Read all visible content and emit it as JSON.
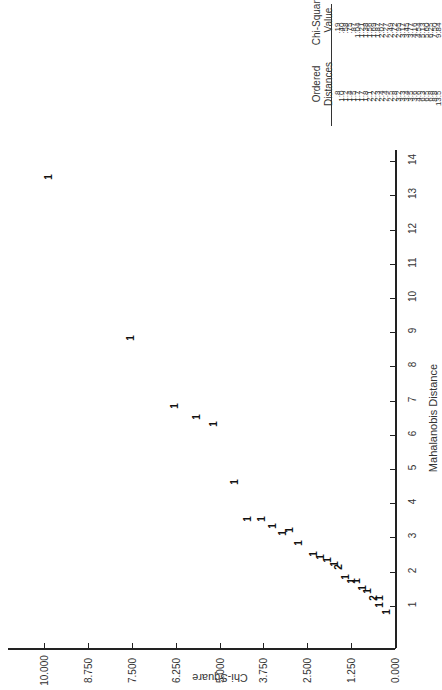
{
  "chart_data": {
    "type": "scatter",
    "title": "",
    "orientation_note_visible": "page rotated 90 degrees",
    "xlabel": "Mahalanobis Distance",
    "ylabel": "Chi-Square",
    "x_ticks": [
      "1",
      "2",
      "3",
      "4",
      "5",
      "6",
      "7",
      "8",
      "9",
      "10",
      "11",
      "12",
      "13",
      "14"
    ],
    "y_ticks": [
      "0.000",
      "1.250",
      "2.500",
      "3.750",
      "5.000",
      "6.250",
      "7.500",
      "8.750",
      "10.000"
    ],
    "xlim": [
      0,
      14.5
    ],
    "ylim": [
      0,
      10.5
    ],
    "grid": false,
    "marker_glyph": "1",
    "points": [
      {
        "x": 0.8,
        "y": 0.19,
        "label": "1"
      },
      {
        "x": 1.0,
        "y": 0.4,
        "label": "1"
      },
      {
        "x": 1.0,
        "y": 0.4,
        "label": "1"
      },
      {
        "x": 1.2,
        "y": 0.58,
        "label": "2"
      },
      {
        "x": 1.4,
        "y": 0.75,
        "label": "1"
      },
      {
        "x": 1.5,
        "y": 0.87,
        "label": "1"
      },
      {
        "x": 1.7,
        "y": 1.04,
        "label": "1"
      },
      {
        "x": 1.7,
        "y": 1.21,
        "label": "1"
      },
      {
        "x": 1.8,
        "y": 1.38,
        "label": "1"
      },
      {
        "x": 2.1,
        "y": 1.56,
        "label": "2"
      },
      {
        "x": 2.2,
        "y": 1.69,
        "label": "1"
      },
      {
        "x": 2.3,
        "y": 1.87,
        "label": "1"
      },
      {
        "x": 2.4,
        "y": 2.07,
        "label": "1"
      },
      {
        "x": 2.5,
        "y": 2.27,
        "label": "1"
      },
      {
        "x": 2.8,
        "y": 2.72,
        "label": "1"
      },
      {
        "x": 3.2,
        "y": 2.95,
        "label": "1"
      },
      {
        "x": 3.1,
        "y": 3.17,
        "label": "1"
      },
      {
        "x": 3.3,
        "y": 3.45,
        "label": "1"
      },
      {
        "x": 3.5,
        "y": 3.77,
        "label": "1"
      },
      {
        "x": 3.5,
        "y": 4.16,
        "label": "1"
      },
      {
        "x": 4.6,
        "y": 4.54,
        "label": "1"
      },
      {
        "x": 6.3,
        "y": 5.13,
        "label": "1"
      },
      {
        "x": 6.5,
        "y": 5.6,
        "label": "1"
      },
      {
        "x": 6.8,
        "y": 6.25,
        "label": "1"
      },
      {
        "x": 8.8,
        "y": 7.5,
        "label": "1"
      },
      {
        "x": 13.5,
        "y": 9.84,
        "label": "1"
      }
    ],
    "table": {
      "headers": [
        "Ordered Distances",
        "Chi-Square Value"
      ],
      "header_lines": [
        [
          "Ordered",
          "Distances"
        ],
        [
          "Chi-Square",
          "Value"
        ]
      ],
      "ordered_distances": [
        ".8",
        "1.0",
        "1.2",
        "1.4",
        "1.5",
        "1.7",
        "1.7",
        "1.8",
        "2.1",
        "2.2",
        "2.3",
        "2.4",
        "2.4",
        "2.5",
        "2.8",
        "3.2",
        "3.3",
        "3.4",
        "3.5",
        "3.6",
        "4.6",
        "6.3",
        "6.5",
        "6.8",
        "8.8",
        "13.5"
      ],
      "chi_square_values": [
        ".19",
        ".40",
        ".58",
        ".75",
        ".87",
        "1.04",
        "1.21",
        "1.38",
        "1.56",
        "1.69",
        "1.87",
        "2.07",
        "2.27",
        "2.49",
        "2.72",
        "2.95",
        "3.17",
        "3.45",
        "3.77",
        "4.16",
        "4.54",
        "5.13",
        "5.60",
        "6.25",
        "7.50",
        "9.84"
      ]
    }
  }
}
